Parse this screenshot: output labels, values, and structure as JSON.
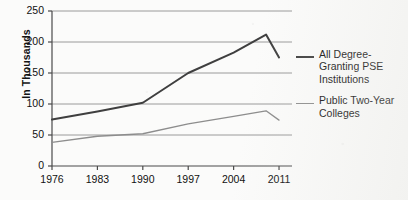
{
  "chart_data": {
    "type": "line",
    "title": "",
    "xlabel": "",
    "ylabel": "In Thousands",
    "x": [
      1976,
      1983,
      1990,
      1997,
      2004,
      2011
    ],
    "xlim": [
      1976,
      2013
    ],
    "ylim": [
      0,
      250
    ],
    "yticks": [
      0,
      50,
      100,
      150,
      200,
      250
    ],
    "xticks": [
      "1976",
      "1983",
      "1990",
      "1997",
      "2004",
      "2011"
    ],
    "grid": "horizontal",
    "legend_position": "right",
    "series": [
      {
        "name": "All Degree-Granting PSE Institutions",
        "color": "#3f3f3f",
        "width": 2,
        "points": [
          {
            "x": 1976,
            "y": 75
          },
          {
            "x": 1983,
            "y": 88
          },
          {
            "x": 1990,
            "y": 102
          },
          {
            "x": 1997,
            "y": 150
          },
          {
            "x": 2004,
            "y": 183
          },
          {
            "x": 2009,
            "y": 212
          },
          {
            "x": 2011,
            "y": 175
          }
        ]
      },
      {
        "name": "Public Two-Year Colleges",
        "color": "#8d8d8d",
        "width": 1.3,
        "points": [
          {
            "x": 1976,
            "y": 38
          },
          {
            "x": 1983,
            "y": 48
          },
          {
            "x": 1990,
            "y": 52
          },
          {
            "x": 1997,
            "y": 68
          },
          {
            "x": 2004,
            "y": 80
          },
          {
            "x": 2009,
            "y": 89
          },
          {
            "x": 2011,
            "y": 74
          }
        ]
      }
    ]
  },
  "axis": {
    "y_label": "In Thousands",
    "y_ticks": [
      "250",
      "200",
      "150",
      "100",
      "50",
      "0"
    ],
    "x_ticks": [
      "1976",
      "1983",
      "1990",
      "1997",
      "2004",
      "2011"
    ]
  },
  "legend": {
    "items": [
      {
        "label": "All Degree-Granting PSE Institutions",
        "color": "#3f3f3f",
        "style": "thick"
      },
      {
        "label": "Public Two-Year Colleges",
        "color": "#8d8d8d",
        "style": "thin"
      }
    ]
  },
  "colors": {
    "series_primary": "#3f3f3f",
    "series_secondary": "#8d8d8d",
    "grid": "#9a9a9a",
    "axis": "#4a4a4a",
    "background": "#fbfbfa"
  }
}
